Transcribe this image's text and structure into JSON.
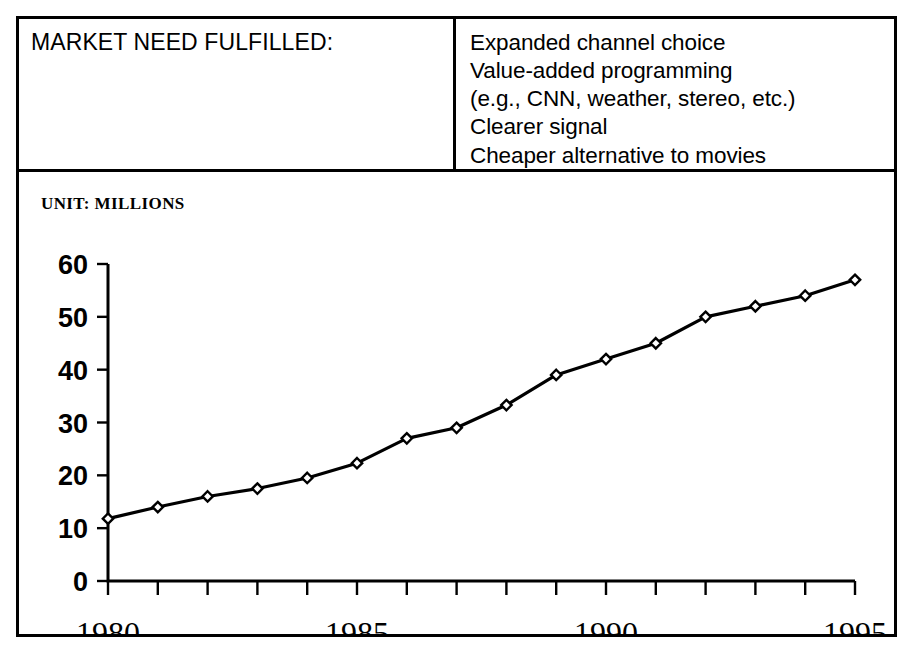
{
  "header": {
    "label": "MARKET NEED FULFILLED:",
    "bullets": [
      "Expanded channel choice",
      "Value-added programming",
      "(e.g., CNN, weather, stereo, etc.)",
      "Clearer signal",
      "Cheaper alternative to movies"
    ]
  },
  "chart": {
    "unit_label": "UNIT: MILLIONS"
  },
  "chart_data": {
    "type": "line",
    "title": "",
    "subtitle": "",
    "xlabel": "",
    "ylabel": "UNIT: MILLIONS",
    "x": [
      1980,
      1981,
      1982,
      1983,
      1984,
      1985,
      1986,
      1987,
      1988,
      1989,
      1990,
      1991,
      1992,
      1993,
      1994,
      1995
    ],
    "values": [
      11.8,
      14.0,
      16.0,
      17.5,
      19.5,
      22.3,
      27.0,
      29.0,
      33.3,
      39.0,
      42.0,
      45.0,
      50.0,
      52.0,
      54.0,
      57.0
    ],
    "series": [
      {
        "name": "Cable subscribers",
        "values": [
          11.8,
          14.0,
          16.0,
          17.5,
          19.5,
          22.3,
          27.0,
          29.0,
          33.3,
          39.0,
          42.0,
          45.0,
          50.0,
          52.0,
          54.0,
          57.0
        ]
      }
    ],
    "ytick_labels": [
      "60",
      "50",
      "40",
      "30",
      "20",
      "10",
      "0"
    ],
    "ytick_values": [
      60,
      50,
      40,
      30,
      20,
      10,
      0
    ],
    "xtick_labels": [
      "1980",
      "1985",
      "1990",
      "1995"
    ],
    "xtick_values": [
      1980,
      1985,
      1990,
      1995
    ],
    "xlim": [
      1980,
      1995
    ],
    "ylim": [
      0,
      60
    ],
    "grid": false,
    "legend": false,
    "marker": "diamond",
    "line_color": "#000000",
    "marker_face_color": "#ffffff",
    "marker_edge_color": "#000000"
  }
}
